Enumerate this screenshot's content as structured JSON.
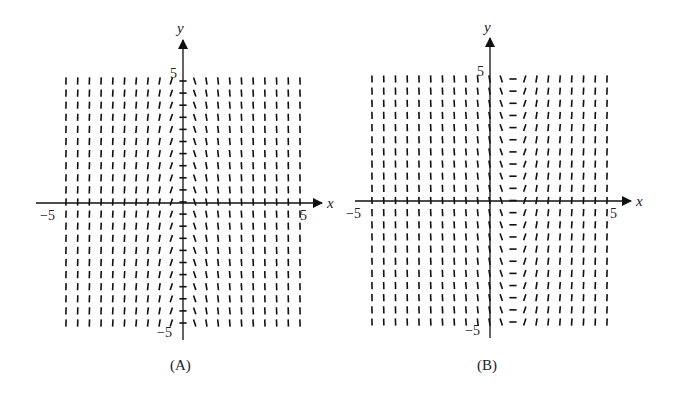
{
  "chart_data": [
    {
      "type": "slope_field",
      "panel_label": "(A)",
      "xlabel": "x",
      "ylabel": "y",
      "xlim": [
        -5,
        5
      ],
      "ylim": [
        -5,
        5
      ],
      "x_tick_labels": [
        "-5",
        "5"
      ],
      "y_tick_labels": [
        "5",
        "-5"
      ],
      "grid_points_per_axis": 21,
      "slope_description": "slopes depend only on x: positive for x<0, negative for x>0, near-horizontal close to x=0, nearly vertical for large |x|",
      "approx_equation": "dy/dx = -k x"
    },
    {
      "type": "slope_field",
      "panel_label": "(B)",
      "xlabel": "x",
      "ylabel": "y",
      "xlim": [
        -5,
        5
      ],
      "ylim": [
        -5,
        5
      ],
      "x_tick_labels": [
        "-5",
        "5"
      ],
      "y_tick_labels": [
        "5",
        "-5"
      ],
      "grid_points_per_axis": 21,
      "slope_description": "slopes depend only on x: steep negative for x<0, zero near x≈1, positive and steepening for x>1",
      "approx_equation": "dy/dx = k (x - 1)"
    }
  ],
  "panels": [
    {
      "label": "(A)",
      "x_axis": "x",
      "y_axis": "y",
      "x_min": "−5",
      "x_max": "5",
      "y_max": "5",
      "y_min": "−5"
    },
    {
      "label": "(B)",
      "x_axis": "x",
      "y_axis": "y",
      "x_min": "−5",
      "x_max": "5",
      "y_max": "5",
      "y_min": "−5"
    }
  ]
}
